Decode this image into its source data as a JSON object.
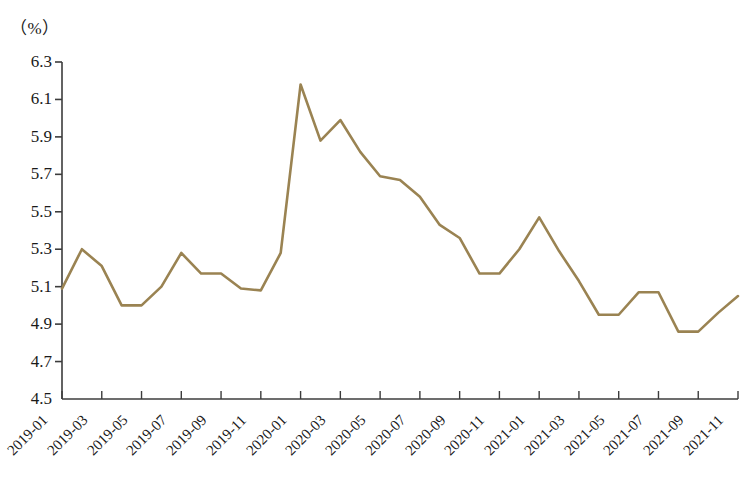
{
  "axis_unit_label": "（%）",
  "colors": {
    "line": "#9a8352",
    "axis": "#3c3c3c",
    "text": "#1a1a1a",
    "background": "#ffffff"
  },
  "chart_data": {
    "type": "line",
    "title": "",
    "subtitle": "",
    "xlabel": "",
    "ylabel": "（%）",
    "grid": false,
    "legend": "none",
    "ylim": [
      4.5,
      6.3
    ],
    "ytick_step": 0.2,
    "ytick_labels": [
      "6.3",
      "6.1",
      "5.9",
      "5.7",
      "5.5",
      "5.3",
      "5.1",
      "4.9",
      "4.7",
      "4.5"
    ],
    "ytick_values": [
      6.3,
      6.1,
      5.9,
      5.7,
      5.5,
      5.3,
      5.1,
      4.9,
      4.7,
      4.5
    ],
    "xtick_labels": [
      "2019-01",
      "2019-03",
      "2019-05",
      "2019-07",
      "2019-09",
      "2019-11",
      "2020-01",
      "2020-03",
      "2020-05",
      "2020-07",
      "2020-09",
      "2020-11",
      "2021-01",
      "2021-03",
      "2021-05",
      "2021-07",
      "2021-09",
      "2021-11"
    ],
    "xtick_interval_months": 2,
    "x": [
      "2019-01",
      "2019-02",
      "2019-03",
      "2019-04",
      "2019-05",
      "2019-06",
      "2019-07",
      "2019-08",
      "2019-09",
      "2019-10",
      "2019-11",
      "2019-12",
      "2020-01",
      "2020-02",
      "2020-03",
      "2020-04",
      "2020-05",
      "2020-06",
      "2020-07",
      "2020-08",
      "2020-09",
      "2020-10",
      "2020-11",
      "2020-12",
      "2021-01",
      "2021-02",
      "2021-03",
      "2021-04",
      "2021-05",
      "2021-06",
      "2021-07",
      "2021-08",
      "2021-09",
      "2021-10",
      "2021-11"
    ],
    "values": [
      5.09,
      5.3,
      5.21,
      5.0,
      5.0,
      5.1,
      5.28,
      5.17,
      5.17,
      5.09,
      5.08,
      5.28,
      6.18,
      5.88,
      5.99,
      5.82,
      5.69,
      5.67,
      5.58,
      5.43,
      5.36,
      5.17,
      5.17,
      5.3,
      5.47,
      5.29,
      5.13,
      4.95,
      4.95,
      5.07,
      5.07,
      4.86,
      4.86,
      4.96,
      5.05
    ],
    "series_name": "城镇调查失业率"
  }
}
